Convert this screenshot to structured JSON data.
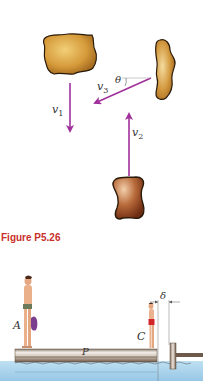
{
  "figure_top": {
    "labels": {
      "v1": {
        "symbol": "v",
        "subscript": "1"
      },
      "v2": {
        "symbol": "v",
        "subscript": "2"
      },
      "v3": {
        "symbol": "v",
        "subscript": "3"
      },
      "theta": "θ"
    },
    "colors": {
      "arrow": "#a0309a",
      "rock_light": "#e9b860",
      "rock_dark": "#a56a1e",
      "rock_bottom_light": "#e8b48a",
      "rock_bottom_dark": "#7a3a18",
      "outline": "#2a1a0a"
    }
  },
  "caption": "Figure P5.26",
  "figure_bottom": {
    "labels": {
      "A": "A",
      "C": "C",
      "P": "P",
      "delta": "δ"
    },
    "colors": {
      "water": "#a9d3ec",
      "plank": "#d8cfc6",
      "plank_dark": "#7a6658",
      "swimsuit_c": "#d3262a",
      "towel": "#7b3e8e",
      "skin": "#e9b08a"
    }
  }
}
